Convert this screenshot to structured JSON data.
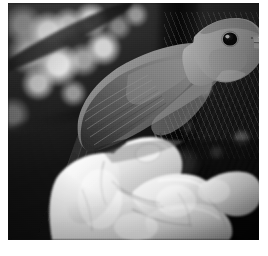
{
  "figure": {
    "kind": "photograph",
    "medium": "black-and-white photograph",
    "caption": "",
    "subject": {
      "primary": "bird",
      "common_description": "small perching songbird (thrush / nightingale type)",
      "held_by": "human right hand",
      "pose": "bird facing right, head raised, bill open-pointed, tail hanging down to the lower left",
      "parts_visible": [
        "head",
        "eye",
        "bill",
        "nape",
        "back",
        "folded wing",
        "primary feathers",
        "tail",
        "breast"
      ]
    },
    "hand": {
      "description": "pale human hand, fingers curled into a loose fist, thumb and index finger gripping the bird's legs",
      "digits_visible": [
        "thumb",
        "index finger",
        "middle finger",
        "ring finger",
        "little finger"
      ]
    },
    "background": {
      "description": "dark out-of-focus woodland foliage with bright bokeh highlights in the upper left and a vertical dark trunk right of centre",
      "elements": [
        "blurred leaves",
        "bokeh light spots",
        "diagonal branch",
        "tree trunk",
        "fern fronds"
      ]
    },
    "composition": {
      "orientation": "landscape-ish square",
      "color_mode": "grayscale",
      "border": "thin white margin on all sides"
    }
  },
  "palette": {
    "page_background": "#ffffff",
    "photo_darkest": "#0b0b0b",
    "photo_shadow": "#1b1b1b",
    "foliage_mid": "#3c3c3c",
    "bird_dark": "#2e2e2e",
    "bird_mid": "#6f6f6f",
    "bird_light": "#a9a9a9",
    "bird_highlight": "#c9c9c9",
    "hand_shadow": "#8d8d8d",
    "hand_mid": "#cfcfcf",
    "hand_highlight": "#f2f2f2",
    "bokeh_highlight": "#efefef",
    "eye_color": "#0a0a0a"
  },
  "geometry": {
    "canvas_width": 268,
    "canvas_height": 256,
    "photo_left": 8,
    "photo_top": 3,
    "photo_width": 251,
    "photo_height": 237
  }
}
